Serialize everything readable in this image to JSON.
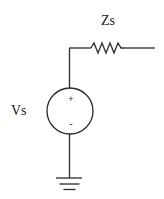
{
  "diagram": {
    "type": "circuit-schematic",
    "components": {
      "impedance": {
        "label": "Zs",
        "symbol": "resistor-zigzag"
      },
      "source": {
        "label": "Vs",
        "symbol": "voltage-source-circle",
        "positive_marker": "+",
        "negative_marker": "-"
      },
      "ground": {
        "symbol": "ground"
      }
    },
    "colors": {
      "stroke": "#2a2a2a",
      "text": "#1a1a1a",
      "background": "#ffffff"
    }
  }
}
